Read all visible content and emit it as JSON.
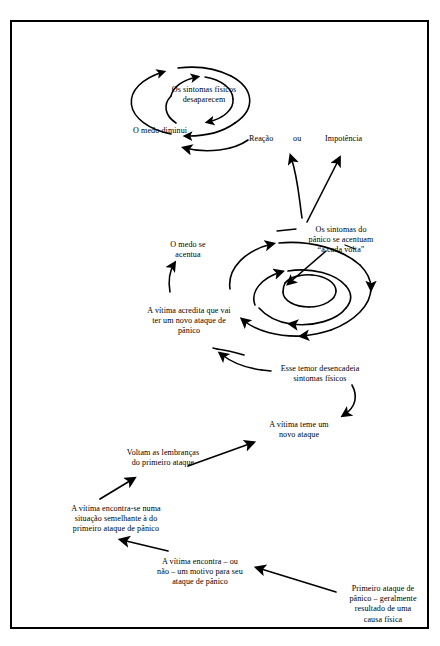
{
  "figure": {
    "language": "pt-BR",
    "border_color": "#000000",
    "background_color": "#ffffff",
    "ink_color": "#000000"
  },
  "labels": {
    "sintomas_desaparecem": "Os sintomas físicos\ndesaparecem",
    "medo_diminui": "O medo diminui",
    "reacao": "Reação",
    "ou": "ou",
    "impotencia": "Impotência",
    "sintomas_acentuam": "Os sintomas do\npânico se acentuam\n“a cada volta”",
    "medo_se_acentua": "O medo se\nacentua",
    "vitima_acredita": "A vítima acredita que vai\nter um novo ataque de\npânico",
    "esse_temor": "Esse temor desencadeia\nsintomas físicos",
    "vitima_teme": "A vítima teme um\nnovo ataque",
    "voltam_lembrancas": "Voltam as lembranças\ndo primeiro ataque",
    "vitima_encontra_se": "A vítima encontra-se numa\nsituação semelhante à do\nprimeiro ataque de pânico",
    "vitima_encontra_motivo": "A vítima encontra – ou\nnão – um motivo para seu\nataque de pânico",
    "primeiro_ataque": "Primeiro ataque de\npânico – geralmente\nresultado de uma\ncausa física"
  }
}
